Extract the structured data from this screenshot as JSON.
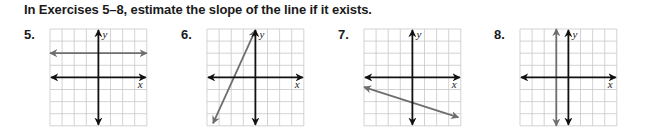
{
  "instruction": "In Exercises 5–8, estimate the slope of the line if it exists.",
  "grid": {
    "cells": 8,
    "cell_px": 12.1,
    "grid_color": "#c8c8c8",
    "axis_color": "#111111",
    "line_color": "#6e6e6e"
  },
  "exercises": [
    {
      "number": "5.",
      "x_label": "x",
      "y_label": "y",
      "line": {
        "type": "horizontal",
        "y": 2,
        "from": [
          -4,
          2
        ],
        "to": [
          4,
          2
        ]
      }
    },
    {
      "number": "6.",
      "x_label": "x",
      "y_label": "y",
      "line": {
        "type": "oblique",
        "from": [
          -3.5,
          -3.8
        ],
        "to": [
          0,
          3.9
        ],
        "estimated_slope": 2.2
      }
    },
    {
      "number": "7.",
      "x_label": "x",
      "y_label": "y",
      "line": {
        "type": "oblique",
        "from": [
          -4,
          -0.8
        ],
        "to": [
          3.8,
          -3.3
        ],
        "estimated_slope": -0.33
      }
    },
    {
      "number": "8.",
      "x_label": "x",
      "y_label": "y",
      "line": {
        "type": "vertical",
        "x": -1,
        "from": [
          -1,
          -4
        ],
        "to": [
          -1,
          4
        ]
      }
    }
  ]
}
